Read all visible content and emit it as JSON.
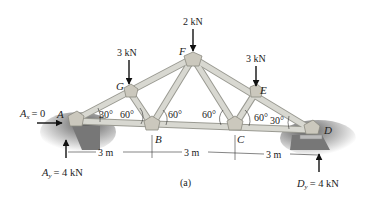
{
  "diagram": {
    "caption": "(a)",
    "joints": {
      "A": {
        "label": "A",
        "x": 75,
        "y": 120
      },
      "B": {
        "label": "B",
        "x": 152,
        "y": 125
      },
      "C": {
        "label": "C",
        "x": 235,
        "y": 125
      },
      "D": {
        "label": "D",
        "x": 312,
        "y": 130
      },
      "E": {
        "label": "E",
        "x": 256,
        "y": 92
      },
      "F": {
        "label": "F",
        "x": 193,
        "y": 58
      },
      "G": {
        "label": "G",
        "x": 130,
        "y": 92
      }
    },
    "loads": {
      "G": "3 kN",
      "F": "2 kN",
      "E": "3 kN"
    },
    "reactions": {
      "Ax_name": "A",
      "Ax_sub": "x",
      "Ax_value": "= 0",
      "Ay_name": "A",
      "Ay_sub": "y",
      "Ay_value": "= 4 kN",
      "Dy_name": "D",
      "Dy_sub": "y",
      "Dy_value": "= 4 kN"
    },
    "angles": {
      "a1": "30°",
      "a2": "60°",
      "a3": "60°",
      "a4": "60°",
      "a5": "60°",
      "a6": "30°"
    },
    "dimensions": [
      "3 m",
      "3 m",
      "3 m"
    ],
    "colors": {
      "member_fill": "#d6d6cf",
      "member_edge": "#9a9a92",
      "gusset": "#c9c6bb",
      "ground": "#6e6e6e",
      "arrow": "#111111"
    }
  }
}
